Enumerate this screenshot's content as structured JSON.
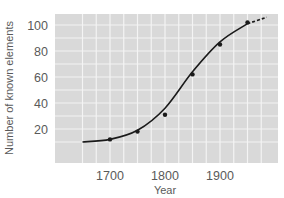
{
  "chart_data": {
    "type": "line",
    "title": "",
    "xlabel": "Year",
    "ylabel": "Number of known elements",
    "xlim": [
      1625,
      2000
    ],
    "ylim": [
      0,
      110
    ],
    "x_ticks": [
      1700,
      1800,
      1900
    ],
    "y_ticks": [
      20,
      40,
      60,
      80,
      100
    ],
    "grid": true,
    "legend": null,
    "series": [
      {
        "name": "Known elements (markers)",
        "x": [
          1700,
          1750,
          1800,
          1850,
          1900,
          1950
        ],
        "values": [
          12,
          18,
          31,
          62,
          85,
          102
        ]
      },
      {
        "name": "Fitted trend (solid, then dashed extrapolation)",
        "x": [
          1650,
          1700,
          1750,
          1800,
          1850,
          1900,
          1950,
          1985
        ],
        "values": [
          10,
          12,
          19,
          36,
          64,
          87,
          101,
          106
        ],
        "dashed_after": 1950
      }
    ],
    "colors": {
      "plot_background": "#d9d9d9",
      "grid": "#f4f4f4",
      "line": "#1a1a1a"
    }
  },
  "labels": {
    "y_ticks": [
      "100",
      "80",
      "60",
      "40",
      "20"
    ],
    "x_ticks": [
      "1700",
      "1800",
      "1900"
    ],
    "xlabel": "Year",
    "ylabel": "Number of known elements"
  }
}
